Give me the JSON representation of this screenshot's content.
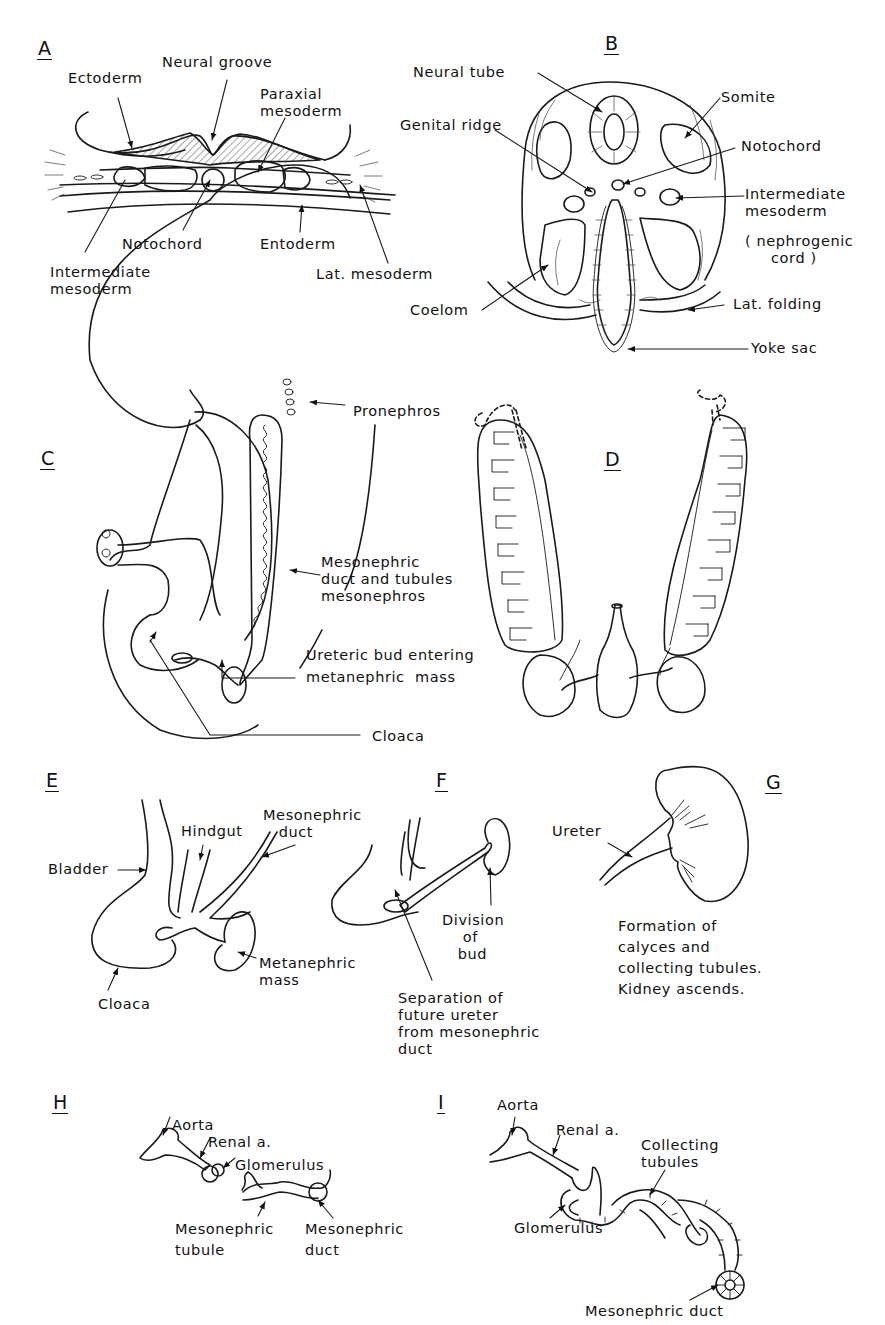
{
  "figure": {
    "panels": [
      {
        "id": "A",
        "letter": "A",
        "labels": {
          "ectoderm": "Ectoderm",
          "neural_groove": "Neural groove",
          "paraxial_mesoderm": "Paraxial\nmesoderm",
          "notochord": "Notochord",
          "entoderm": "Entoderm",
          "intermediate_mesoderm": "Intermediate\nmesoderm",
          "lat_mesoderm": "Lat. mesoderm"
        }
      },
      {
        "id": "B",
        "letter": "B",
        "labels": {
          "neural_tube": "Neural tube",
          "somite": "Somite",
          "genital_ridge": "Genital ridge",
          "notochord": "Notochord",
          "intermediate_mesoderm": "Intermediate\nmesoderm",
          "nephrogenic_cord": "( nephrogenic\n     cord )",
          "coelom": "Coelom",
          "lat_folding": "Lat. folding",
          "yoke_sac": "Yoke sac"
        }
      },
      {
        "id": "C",
        "letter": "C",
        "labels": {
          "pronephros": "Pronephros",
          "mesonephric_duct": "Mesonephric\nduct and tubules\nmesonephros",
          "ureteric_bud": "Ureteric bud entering\nmetanephric  mass",
          "cloaca": "Cloaca"
        }
      },
      {
        "id": "D",
        "letter": "D",
        "labels": {}
      },
      {
        "id": "E",
        "letter": "E",
        "labels": {
          "bladder": "Bladder",
          "hindgut": "Hindgut",
          "mesonephric_duct": "Mesonephric\n   duct",
          "metanephric_mass": "Metanephric\nmass",
          "cloaca": "Cloaca"
        }
      },
      {
        "id": "F",
        "letter": "F",
        "labels": {
          "division_of_bud": "Division\n    of\n   bud",
          "separation": "Separation of\nfuture ureter\nfrom mesonephric\nduct"
        }
      },
      {
        "id": "G",
        "letter": "G",
        "labels": {
          "ureter": "Ureter",
          "caption": "Formation of\ncalyces and\ncollecting tubules.\nKidney ascends."
        }
      },
      {
        "id": "H",
        "letter": "H",
        "labels": {
          "aorta": "Aorta",
          "renal_a": "Renal a.",
          "glomerulus": "Glomerulus",
          "mesonephric_tubule": "Mesonephric\ntubule",
          "mesonephric_duct": "Mesonephric\nduct"
        }
      },
      {
        "id": "I",
        "letter": "I",
        "labels": {
          "aorta": "Aorta",
          "renal_a": "Renal a.",
          "collecting_tubules": "Collecting\ntubules",
          "glomerulus": "Glomerulus",
          "mesonephric_duct": "Mesonephric duct"
        }
      }
    ]
  }
}
